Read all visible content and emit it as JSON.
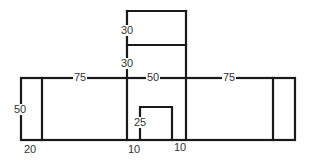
{
  "diagram": {
    "type": "building-front-elevation",
    "stroke_color": "#1a1a1a",
    "labels": {
      "tower_upper_height": "30",
      "tower_lower_height": "30",
      "left_wing_width": "75",
      "center_width": "50",
      "right_wing_width": "75",
      "wall_height": "50",
      "side_bay_width": "20",
      "door_height": "25",
      "door_left_offset": "10",
      "door_right_offset": "10"
    }
  }
}
